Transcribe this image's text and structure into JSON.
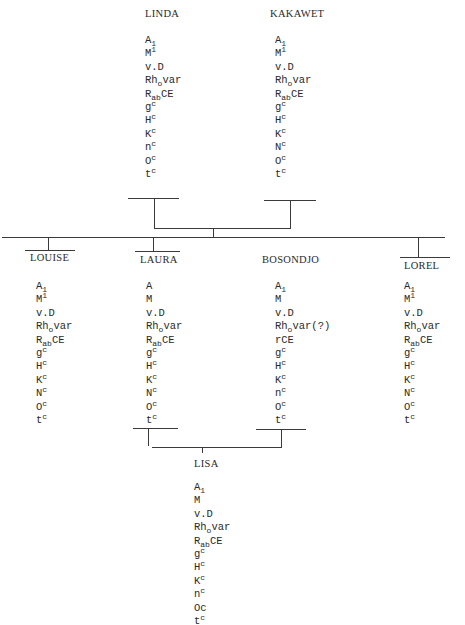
{
  "persons": {
    "linda": {
      "name": "LINDA",
      "markers": [
        [
          "A",
          "",
          "1"
        ],
        [
          "M",
          "1",
          ""
        ],
        [
          "v.D",
          "",
          ""
        ],
        [
          "Rh",
          "",
          "o",
          "var"
        ],
        [
          "R",
          "",
          "ab",
          "CE"
        ],
        [
          "g",
          "c",
          ""
        ],
        [
          "H",
          "c",
          ""
        ],
        [
          "K",
          "c",
          ""
        ],
        [
          "n",
          "c",
          ""
        ],
        [
          "O",
          "c",
          ""
        ],
        [
          "t",
          "c",
          ""
        ]
      ]
    },
    "kakawet": {
      "name": "KAKAWET",
      "markers": [
        [
          "A",
          "",
          "1"
        ],
        [
          "M",
          "1",
          ""
        ],
        [
          "v.D",
          "",
          ""
        ],
        [
          "Rh",
          "",
          "o",
          "var"
        ],
        [
          "R",
          "",
          "ab",
          "CE"
        ],
        [
          "g",
          "c",
          ""
        ],
        [
          "H",
          "c",
          ""
        ],
        [
          "K",
          "c",
          ""
        ],
        [
          "N",
          "c",
          ""
        ],
        [
          "O",
          "c",
          ""
        ],
        [
          "t",
          "c",
          ""
        ]
      ]
    },
    "louise": {
      "name": "LOUISE",
      "markers": [
        [
          "A",
          "",
          "1"
        ],
        [
          "M",
          "1",
          ""
        ],
        [
          "v.D",
          "",
          ""
        ],
        [
          "Rh",
          "",
          "o",
          "var"
        ],
        [
          "R",
          "",
          "ab",
          "CE"
        ],
        [
          "g",
          "c",
          ""
        ],
        [
          "H",
          "c",
          ""
        ],
        [
          "K",
          "c",
          ""
        ],
        [
          "N",
          "c",
          ""
        ],
        [
          "O",
          "c",
          ""
        ],
        [
          "t",
          "c",
          ""
        ]
      ]
    },
    "laura": {
      "name": "LAURA",
      "markers": [
        [
          "A",
          "",
          ""
        ],
        [
          "M",
          "",
          ""
        ],
        [
          "v.D",
          "",
          ""
        ],
        [
          "Rh",
          "",
          "o",
          "var"
        ],
        [
          "R",
          "",
          "ab",
          "CE"
        ],
        [
          "g",
          "c",
          ""
        ],
        [
          "H",
          "c",
          ""
        ],
        [
          "K",
          "c",
          ""
        ],
        [
          "N",
          "c",
          ""
        ],
        [
          "O",
          "c",
          ""
        ],
        [
          "t",
          "c",
          ""
        ]
      ]
    },
    "bosondjo": {
      "name": "BOSONDJO",
      "markers": [
        [
          "A",
          "",
          "1"
        ],
        [
          "M",
          "",
          ""
        ],
        [
          "v.D",
          "",
          ""
        ],
        [
          "Rh",
          "",
          "o",
          "var(?)"
        ],
        [
          "rCE",
          "",
          ""
        ],
        [
          "g",
          "c",
          ""
        ],
        [
          "H",
          "c",
          ""
        ],
        [
          "K",
          "c",
          ""
        ],
        [
          "n",
          "c",
          ""
        ],
        [
          "O",
          "c",
          ""
        ],
        [
          "t",
          "c",
          ""
        ]
      ]
    },
    "lorel": {
      "name": "LOREL",
      "markers": [
        [
          "A",
          "",
          "1"
        ],
        [
          "M",
          "1",
          ""
        ],
        [
          "v.D",
          "",
          ""
        ],
        [
          "Rh",
          "",
          "o",
          "var"
        ],
        [
          "R",
          "",
          "ab",
          "CE"
        ],
        [
          "g",
          "c",
          ""
        ],
        [
          "H",
          "c",
          ""
        ],
        [
          "K",
          "c",
          ""
        ],
        [
          "N",
          "c",
          ""
        ],
        [
          "O",
          "c",
          ""
        ],
        [
          "t",
          "c",
          ""
        ]
      ]
    },
    "lisa": {
      "name": "LISA",
      "markers": [
        [
          "A",
          "",
          "1"
        ],
        [
          "M",
          "",
          ""
        ],
        [
          "v.D",
          "",
          ""
        ],
        [
          "Rh",
          "",
          "o",
          "var"
        ],
        [
          "R",
          "",
          "ab",
          "CE"
        ],
        [
          "g",
          "c",
          ""
        ],
        [
          "H",
          "c",
          ""
        ],
        [
          "K",
          "c",
          ""
        ],
        [
          "n",
          "c",
          ""
        ],
        [
          "Oc",
          "",
          ""
        ],
        [
          "t",
          "c",
          ""
        ]
      ]
    }
  },
  "layout": {
    "linda": {
      "x": 145,
      "y": 8,
      "mx": 145,
      "my": 34
    },
    "kakawet": {
      "x": 270,
      "y": 8,
      "mx": 275,
      "my": 34
    },
    "louise": {
      "x": 30,
      "y": 252,
      "mx": 36,
      "my": 280
    },
    "laura": {
      "x": 140,
      "y": 254,
      "mx": 146,
      "my": 280
    },
    "bosondjo": {
      "x": 262,
      "y": 254,
      "mx": 275,
      "my": 280
    },
    "lorel": {
      "x": 404,
      "y": 260,
      "mx": 404,
      "my": 280
    },
    "lisa": {
      "x": 194,
      "y": 458,
      "mx": 194,
      "my": 481
    }
  }
}
